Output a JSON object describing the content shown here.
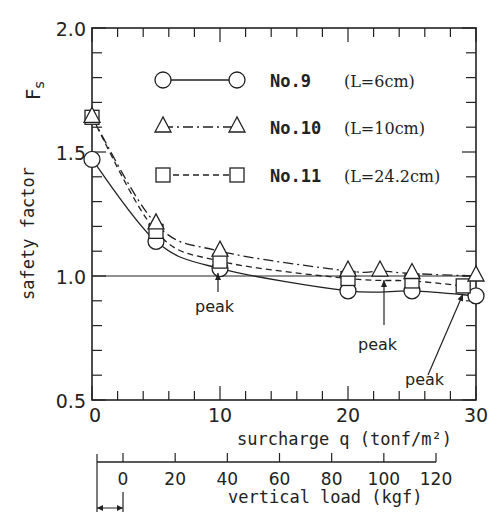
{
  "chart_data": {
    "type": "line",
    "title": "",
    "xlabel": "surcharge q (tonf/m²)",
    "ylabel": "safety factor  Fs",
    "ylabel_main": "safety factor",
    "ylabel_symbol": "Fs",
    "xlim": [
      0,
      30
    ],
    "ylim": [
      0.5,
      2.0
    ],
    "x_ticks": [
      "0",
      "10",
      "20",
      "30"
    ],
    "y_ticks": [
      "0.5",
      "1.0",
      "1.5",
      "2.0"
    ],
    "reference_line": {
      "y": 1.0
    },
    "grid": false,
    "legend_position": "upper right (inside)",
    "series": [
      {
        "name": "No.9",
        "note": "(L=6cm)",
        "marker": "circle",
        "line": "solid",
        "x": [
          0,
          5,
          10,
          20,
          25,
          30
        ],
        "y": [
          1.47,
          1.14,
          1.03,
          0.94,
          0.94,
          0.92
        ]
      },
      {
        "name": "No.10",
        "note": "(L=10cm)",
        "marker": "triangle",
        "line": "dash-dot",
        "x": [
          0,
          5,
          10,
          20,
          22.5,
          25,
          30
        ],
        "y": [
          1.64,
          1.21,
          1.1,
          1.02,
          1.02,
          1.01,
          1.0
        ]
      },
      {
        "name": "No.11",
        "note": "(L=24.2cm)",
        "marker": "square",
        "line": "dashed",
        "x": [
          0,
          5,
          10,
          20,
          25,
          29
        ],
        "y": [
          1.64,
          1.18,
          1.06,
          0.99,
          0.98,
          0.96
        ]
      }
    ],
    "annotations": [
      {
        "text": "peak",
        "series": "No.9",
        "x": 10,
        "y": 1.03
      },
      {
        "text": "peak",
        "series": "No.10",
        "x": 22.5,
        "y": 1.02
      },
      {
        "text": "peak",
        "series": "No.11",
        "x": 29,
        "y": 0.96
      }
    ],
    "secondary_x_axis": {
      "label": "vertical load (kgf)",
      "ticks": [
        "0",
        "20",
        "40",
        "60",
        "80",
        "100",
        "120"
      ]
    }
  },
  "labels": {
    "y_symbol": "Fs",
    "y_title": "safety factor",
    "x_title": "surcharge q (tonf/m²)",
    "x2_title": "vertical load (kgf)",
    "peak": "peak"
  }
}
